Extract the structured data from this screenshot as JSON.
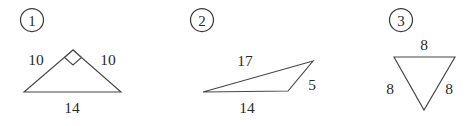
{
  "figure": {
    "background_color": "#ffffff",
    "stroke_color": "#474747",
    "text_color": "#2b2b2b",
    "items": [
      {
        "index": "1",
        "index_position": {
          "x": 32,
          "y": 20
        },
        "shape": "triangle",
        "description": "isosceles right triangle, right angle at apex",
        "right_angle_marked": true,
        "vertices": [
          {
            "x": 24,
            "y": 92
          },
          {
            "x": 73,
            "y": 50
          },
          {
            "x": 121,
            "y": 92
          }
        ],
        "labels": [
          {
            "text": "10",
            "x": 36,
            "y": 65,
            "side": "left"
          },
          {
            "text": "10",
            "x": 108,
            "y": 65,
            "side": "right"
          },
          {
            "text": "14",
            "x": 72,
            "y": 113,
            "side": "base"
          }
        ]
      },
      {
        "index": "2",
        "index_position": {
          "x": 202,
          "y": 20
        },
        "shape": "triangle",
        "description": "scalene obtuse triangle",
        "right_angle_marked": false,
        "vertices": [
          {
            "x": 203,
            "y": 92
          },
          {
            "x": 313,
            "y": 61
          },
          {
            "x": 288,
            "y": 91
          }
        ],
        "labels": [
          {
            "text": "17",
            "x": 245,
            "y": 66,
            "side": "upper"
          },
          {
            "text": "5",
            "x": 312,
            "y": 90,
            "side": "right"
          },
          {
            "text": "14",
            "x": 247,
            "y": 113,
            "side": "base"
          }
        ]
      },
      {
        "index": "3",
        "index_position": {
          "x": 401,
          "y": 20
        },
        "shape": "triangle",
        "description": "equilateral triangle pointing downward",
        "right_angle_marked": false,
        "vertices": [
          {
            "x": 394,
            "y": 57
          },
          {
            "x": 455,
            "y": 57
          },
          {
            "x": 424,
            "y": 110
          }
        ],
        "labels": [
          {
            "text": "8",
            "x": 424,
            "y": 50,
            "side": "top"
          },
          {
            "text": "8",
            "x": 390,
            "y": 94,
            "side": "left"
          },
          {
            "text": "8",
            "x": 449,
            "y": 94,
            "side": "right"
          }
        ]
      }
    ]
  }
}
